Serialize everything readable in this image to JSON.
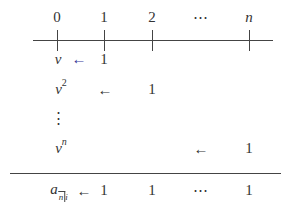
{
  "diagram": {
    "type": "timeline",
    "time_labels": [
      "0",
      "1",
      "2",
      "⋯",
      "n"
    ],
    "rows": [
      {
        "left": "v",
        "arrow": "←",
        "value": "1",
        "value_at": "1"
      },
      {
        "left": "v",
        "exponent": "2",
        "arrow": "←",
        "value": "1",
        "value_at": "2"
      },
      {
        "left": "⋮"
      },
      {
        "left": "v",
        "exponent": "n",
        "arrow": "←",
        "value": "1",
        "value_at": "n"
      }
    ],
    "total_row": {
      "symbol": "a",
      "subscript": "n",
      "subscript_suffix": "i",
      "arrow": "←",
      "values": [
        "1",
        "1",
        "⋯",
        "1"
      ]
    },
    "colors": {
      "line": "#444444",
      "arrow_first": "#3a3a9a"
    }
  }
}
